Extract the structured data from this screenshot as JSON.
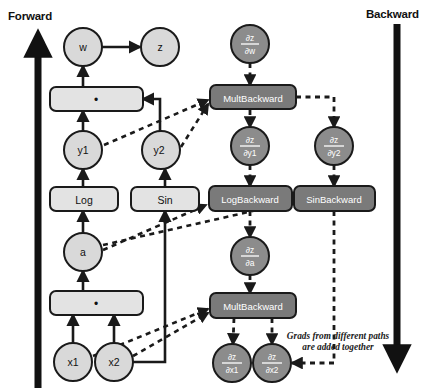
{
  "diagram": {
    "labels": {
      "forward": "Forward",
      "backward": "Backward"
    },
    "annotation": {
      "line1": "Grads from different paths",
      "line2": "are added together"
    },
    "colors": {
      "forward_node_fill": "#d9d9d9",
      "backward_node_fill": "#8c8c8c",
      "forward_box_fill": "#e3e3e3",
      "backward_box_fill": "#7a7a7a",
      "stroke": "#1a1a1a",
      "backward_text": "#ffffff",
      "forward_text": "#111111",
      "background": "#ffffff"
    },
    "forward": {
      "nodes": [
        {
          "id": "w",
          "label": "w",
          "shape": "circle",
          "x": 83,
          "y": 47
        },
        {
          "id": "z",
          "label": "z",
          "shape": "circle",
          "x": 160,
          "y": 47
        },
        {
          "id": "mult_top",
          "label": "•",
          "shape": "box",
          "x": 103,
          "y": 99
        },
        {
          "id": "y1",
          "label": "y1",
          "shape": "circle",
          "x": 83,
          "y": 150
        },
        {
          "id": "y2",
          "label": "y2",
          "shape": "circle",
          "x": 160,
          "y": 150
        },
        {
          "id": "log",
          "label": "Log",
          "shape": "box",
          "x": 83,
          "y": 199
        },
        {
          "id": "sin",
          "label": "Sin",
          "shape": "box",
          "x": 165,
          "y": 199
        },
        {
          "id": "a",
          "label": "a",
          "shape": "circle",
          "x": 83,
          "y": 252
        },
        {
          "id": "mult_bottom",
          "label": "•",
          "shape": "box",
          "x": 96,
          "y": 303
        },
        {
          "id": "x1",
          "label": "x1",
          "shape": "circle",
          "x": 73,
          "y": 362
        },
        {
          "id": "x2",
          "label": "x2",
          "shape": "circle",
          "x": 114,
          "y": 362
        }
      ]
    },
    "backward": {
      "nodes": [
        {
          "id": "dz_dw",
          "num": "∂z",
          "den": "∂w",
          "shape": "circle",
          "x": 250,
          "y": 44
        },
        {
          "id": "multbackward_top",
          "label": "MultBackward",
          "shape": "box",
          "x": 253,
          "y": 97
        },
        {
          "id": "dz_dy1",
          "num": "∂z",
          "den": "∂y1",
          "shape": "circle",
          "x": 250,
          "y": 146
        },
        {
          "id": "dz_dy2",
          "num": "∂z",
          "den": "∂y2",
          "shape": "circle",
          "x": 334,
          "y": 146
        },
        {
          "id": "logbackward",
          "label": "LogBackward",
          "shape": "box",
          "x": 250,
          "y": 198
        },
        {
          "id": "sinbackward",
          "label": "SinBackward",
          "shape": "box",
          "x": 334,
          "y": 198
        },
        {
          "id": "dz_da",
          "num": "∂z",
          "den": "∂a",
          "shape": "circle",
          "x": 250,
          "y": 256
        },
        {
          "id": "multbackward_bottom",
          "label": "MultBackward",
          "shape": "box",
          "x": 253,
          "y": 305
        },
        {
          "id": "dz_dx1",
          "num": "∂z",
          "den": "∂x1",
          "shape": "circle",
          "x": 232,
          "y": 363
        },
        {
          "id": "dz_dx2",
          "num": "∂z",
          "den": "∂x2",
          "shape": "circle",
          "x": 272,
          "y": 363
        }
      ]
    }
  }
}
